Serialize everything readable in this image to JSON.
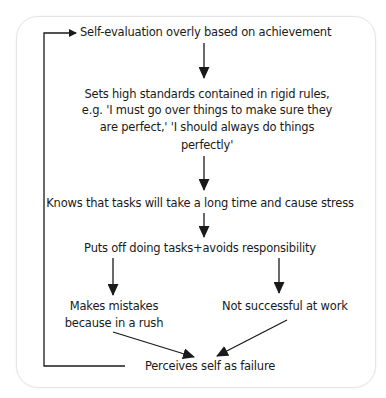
{
  "diagram": {
    "type": "flowchart",
    "nodes": {
      "self_evaluation": "Self-evaluation overly based on achievement",
      "high_standards_1": "Sets high standards contained in rigid rules,",
      "high_standards_2": "e.g. 'I must go over things to make sure they",
      "high_standards_3": "are perfect,' 'I should always do things",
      "high_standards_4": "perfectly'",
      "knows_tasks": "Knows that tasks will take a long time and cause stress",
      "puts_off": "Puts off doing tasks+avoids responsibility",
      "mistakes_1": "Makes mistakes",
      "mistakes_2": "because in a rush",
      "not_successful": "Not successful at work",
      "perceives_failure": "Perceives self as failure"
    },
    "edges": [
      {
        "from": "self_evaluation",
        "to": "high_standards"
      },
      {
        "from": "high_standards",
        "to": "knows_tasks"
      },
      {
        "from": "knows_tasks",
        "to": "puts_off"
      },
      {
        "from": "puts_off",
        "to": "mistakes"
      },
      {
        "from": "puts_off",
        "to": "not_successful"
      },
      {
        "from": "mistakes",
        "to": "perceives_failure"
      },
      {
        "from": "not_successful",
        "to": "perceives_failure"
      },
      {
        "from": "perceives_failure",
        "to": "self_evaluation",
        "style": "feedback-loop"
      }
    ],
    "colors": {
      "line": "#1a1a1a",
      "border": "#e4e4e4",
      "background": "#ffffff"
    }
  }
}
